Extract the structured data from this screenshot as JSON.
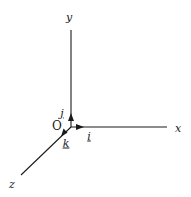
{
  "diagram": {
    "type": "3d-coordinate-axes",
    "colors": {
      "line": "#1a1a1a",
      "background": "#ffffff"
    },
    "origin": {
      "label": "O",
      "x": 71,
      "y": 127
    },
    "axes": [
      {
        "name": "x",
        "label": "x",
        "end": [
          167,
          127
        ],
        "label_pos": [
          178,
          128
        ]
      },
      {
        "name": "y",
        "label": "y",
        "end": [
          71,
          30
        ],
        "label_pos": [
          69,
          17
        ]
      },
      {
        "name": "z",
        "label": "z",
        "end": [
          21,
          175
        ],
        "label_pos": [
          12,
          184
        ]
      }
    ],
    "unit_vectors": [
      {
        "name": "i",
        "label": "i",
        "axis": "x",
        "tip": [
          83,
          127
        ],
        "label_pos": [
          89,
          136
        ]
      },
      {
        "name": "j",
        "label": "j",
        "axis": "y",
        "tip": [
          71,
          114
        ],
        "label_pos": [
          62,
          114
        ]
      },
      {
        "name": "k",
        "label": "k",
        "axis": "z",
        "tip": [
          62,
          135
        ],
        "label_pos": [
          66,
          143
        ]
      }
    ]
  }
}
